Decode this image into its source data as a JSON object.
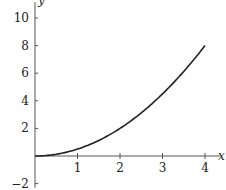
{
  "chart_data": {
    "type": "line",
    "title": "",
    "xlabel": "x",
    "ylabel": "y",
    "xlim": [
      0,
      4.3
    ],
    "ylim": [
      -2.3,
      11
    ],
    "x_ticks": [
      1,
      2,
      3,
      4
    ],
    "y_ticks": [
      -2,
      2,
      4,
      6,
      8,
      10
    ],
    "x_tick_labels": [
      "1",
      "2",
      "3",
      "4"
    ],
    "y_tick_labels": [
      "−2",
      "2",
      "4",
      "6",
      "8",
      "10"
    ],
    "grid": false,
    "legend": null,
    "series": [
      {
        "name": "y = x^2/2",
        "x": [
          0,
          0.5,
          1,
          1.5,
          2,
          2.5,
          3,
          3.5,
          4
        ],
        "values": [
          0,
          0.125,
          0.5,
          1.125,
          2,
          3.125,
          4.5,
          6.125,
          8
        ]
      }
    ],
    "colors": {
      "axis": "#555555",
      "curve": "#222222"
    }
  }
}
